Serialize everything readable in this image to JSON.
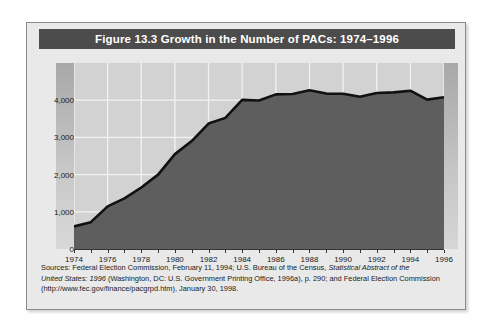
{
  "figure": {
    "title": "Figure 13.3  Growth in the Number of PACs: 1974–1996",
    "title_banner_color": "#4c4c4c",
    "frame_background": "#e9e9e9"
  },
  "source_note": {
    "line1_a": "Sources: Federal Election Commission, February 11, 1994; U.S. Bureau of the Census, ",
    "line1_italic": "Statistical Abstract of the",
    "line2_italic": "United States: 1996",
    "line2_b": " (Washington, DC: U.S. Government Printing Office, 1996a), p. 290; and Federal Election Commission",
    "line3": "(http://www.fec.gov/finance/pacgrpd.htm), January 30, 1998."
  },
  "chart_data": {
    "type": "area",
    "title": "Growth in the Number of PACs: 1974–1996",
    "xlabel": "",
    "ylabel": "Number of PACs",
    "xlim": [
      1974,
      1996
    ],
    "ylim": [
      0,
      5000
    ],
    "grid": true,
    "legend": "none",
    "area_fill_color": "#5e5e5e",
    "line_color": "#111111",
    "plot_background": "#d2d2d2",
    "gridline_color": "#f2f2f2",
    "ytick_labels": [
      "0",
      "1,000",
      "2,000",
      "3,000",
      "4,000"
    ],
    "ytick_values": [
      0,
      1000,
      2000,
      3000,
      4000
    ],
    "xtick_labels": [
      "1974",
      "1976",
      "1978",
      "1980",
      "1982",
      "1984",
      "1986",
      "1988",
      "1990",
      "1992",
      "1994",
      "1996"
    ],
    "xtick_values": [
      1974,
      1976,
      1978,
      1980,
      1982,
      1984,
      1986,
      1988,
      1990,
      1992,
      1994,
      1996
    ],
    "x": [
      1974,
      1975,
      1976,
      1977,
      1978,
      1979,
      1980,
      1981,
      1982,
      1983,
      1984,
      1985,
      1986,
      1987,
      1988,
      1989,
      1990,
      1991,
      1992,
      1993,
      1994,
      1995,
      1996
    ],
    "values": [
      608,
      722,
      1146,
      1360,
      1653,
      2000,
      2551,
      2901,
      3371,
      3525,
      4009,
      3992,
      4157,
      4165,
      4268,
      4178,
      4172,
      4094,
      4195,
      4210,
      4255,
      4016,
      4079
    ],
    "series": [
      {
        "name": "Number of PACs",
        "values": [
          608,
          722,
          1146,
          1360,
          1653,
          2000,
          2551,
          2901,
          3371,
          3525,
          4009,
          3992,
          4157,
          4165,
          4268,
          4178,
          4172,
          4094,
          4195,
          4210,
          4255,
          4016,
          4079
        ]
      }
    ],
    "annotations": []
  }
}
